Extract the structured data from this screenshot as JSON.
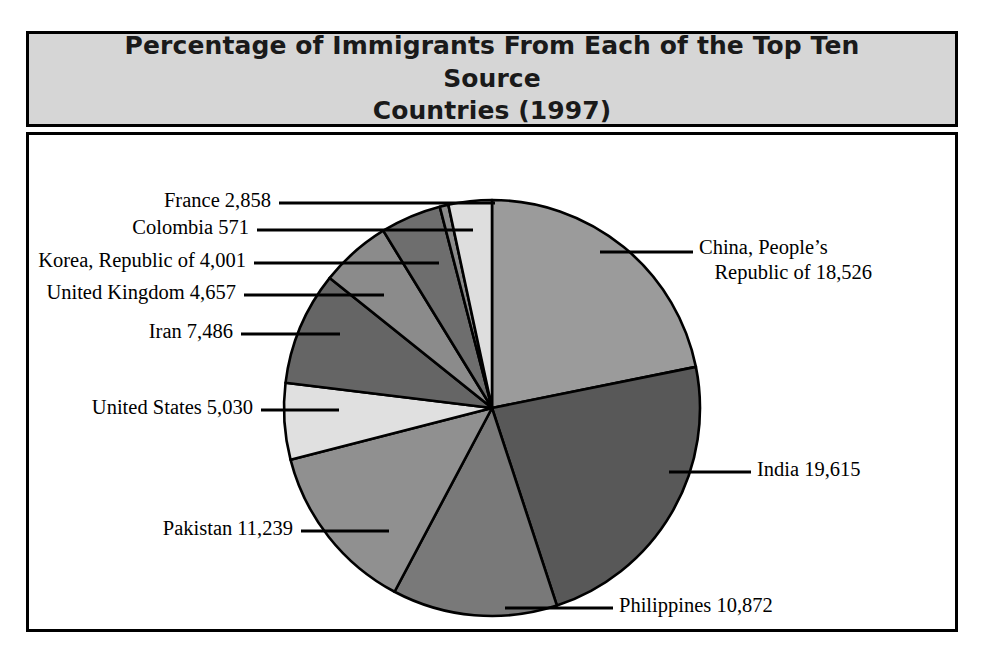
{
  "figure": {
    "title": "Percentage of Immigrants From Each of the Top Ten Source\nCountries (1997)",
    "title_bg": "#d6d6d6",
    "frame_color": "#000000",
    "plot_bg": "#ffffff"
  },
  "labels": {
    "china": "China, People’s\n   Republic of 18,526",
    "india": "India 19,615",
    "philippines": "Philippines 10,872",
    "pakistan": "Pakistan 11,239",
    "united_states": "United States 5,030",
    "iran": "Iran 7,486",
    "united_kingdom": "United Kingdom 4,657",
    "korea": "Korea, Republic of 4,001",
    "colombia": "Colombia 571",
    "france": "France 2,858"
  },
  "chart_data": {
    "type": "pie",
    "title": "Percentage of Immigrants From Each of the Top Ten Source Countries (1997)",
    "xlabel": "",
    "ylabel": "",
    "legend": "none",
    "grid": false,
    "units": "immigrants",
    "total": 85455,
    "start_angle_deg": 0,
    "direction": "clockwise",
    "center": [
      492,
      377
    ],
    "radius": 208,
    "categories": [
      "China, People's Republic of",
      "India",
      "Philippines",
      "Pakistan",
      "United States",
      "Iran",
      "United Kingdom",
      "Korea, Republic of",
      "Colombia",
      "France"
    ],
    "values": [
      18526,
      19615,
      10872,
      11239,
      5030,
      7486,
      4657,
      4001,
      571,
      2858
    ],
    "percentages": [
      21.68,
      22.95,
      12.72,
      13.15,
      5.89,
      8.76,
      5.45,
      4.68,
      0.67,
      3.34
    ],
    "slices": [
      {
        "name": "China, People's Republic of",
        "value": 18526,
        "percent": 21.68,
        "angle_deg": 78.05,
        "color": "#9b9b9b",
        "label_side": "right"
      },
      {
        "name": "India",
        "value": 19615,
        "percent": 22.95,
        "angle_deg": 82.64,
        "color": "#585858",
        "label_side": "right"
      },
      {
        "name": "Philippines",
        "value": 10872,
        "percent": 12.72,
        "angle_deg": 45.8,
        "color": "#797979",
        "label_side": "right"
      },
      {
        "name": "Pakistan",
        "value": 11239,
        "percent": 13.15,
        "angle_deg": 47.35,
        "color": "#909090",
        "label_side": "left"
      },
      {
        "name": "United States",
        "value": 5030,
        "percent": 5.89,
        "angle_deg": 21.19,
        "color": "#e0e0e0",
        "label_side": "left"
      },
      {
        "name": "Iran",
        "value": 7486,
        "percent": 8.76,
        "angle_deg": 31.54,
        "color": "#656565",
        "label_side": "left"
      },
      {
        "name": "United Kingdom",
        "value": 4657,
        "percent": 5.45,
        "angle_deg": 19.62,
        "color": "#8b8b8b",
        "label_side": "left"
      },
      {
        "name": "Korea, Republic of",
        "value": 4001,
        "percent": 4.68,
        "angle_deg": 16.86,
        "color": "#6e6e6e",
        "label_side": "left"
      },
      {
        "name": "Colombia",
        "value": 571,
        "percent": 0.67,
        "angle_deg": 2.41,
        "color": "#8b8b8b",
        "label_side": "left"
      },
      {
        "name": "France",
        "value": 2858,
        "percent": 3.34,
        "angle_deg": 12.04,
        "color": "#dedede",
        "label_side": "left"
      }
    ]
  }
}
